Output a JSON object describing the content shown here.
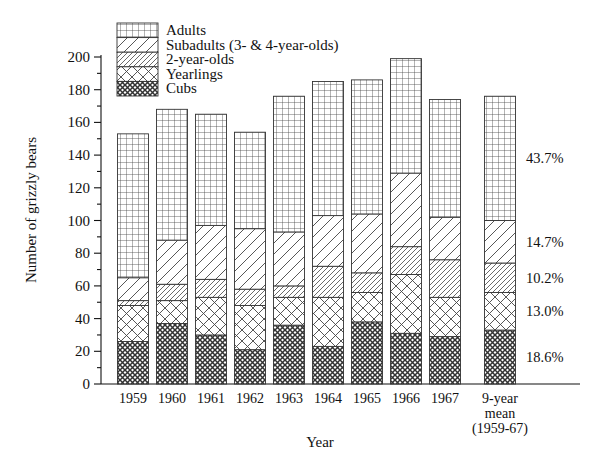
{
  "chart_data": {
    "type": "bar",
    "subtype": "stacked-bar",
    "title": "",
    "xlabel": "Year",
    "ylabel": "Number of grizzly bears",
    "ylim": [
      0,
      200
    ],
    "ytick_step": 20,
    "yticks": [
      0,
      20,
      40,
      60,
      80,
      100,
      120,
      140,
      160,
      180,
      200
    ],
    "minor_ticks": true,
    "grid": false,
    "legend_position": "top-left",
    "categories": [
      "1959",
      "1960",
      "1961",
      "1962",
      "1963",
      "1964",
      "1965",
      "1966",
      "1967",
      "9-year mean (1959-67)"
    ],
    "category_labels_multiline": [
      [
        "1959"
      ],
      [
        "1960"
      ],
      [
        "1961"
      ],
      [
        "1962"
      ],
      [
        "1963"
      ],
      [
        "1964"
      ],
      [
        "1965"
      ],
      [
        "1966"
      ],
      [
        "1967"
      ],
      [
        "9-year",
        "mean",
        "(1959-67)"
      ]
    ],
    "series": [
      {
        "name": "Cubs",
        "pattern": "dense-checker",
        "values": [
          26,
          37,
          30,
          21,
          36,
          23,
          38,
          31,
          29,
          33
        ]
      },
      {
        "name": "Yearlings",
        "pattern": "wide-crosshatch",
        "values": [
          22,
          14,
          23,
          27,
          17,
          30,
          18,
          36,
          24,
          23
        ]
      },
      {
        "name": "2-year-olds",
        "pattern": "dense-diagonal",
        "values": [
          3,
          10,
          11,
          10,
          7,
          19,
          12,
          17,
          23,
          18
        ]
      },
      {
        "name": "Subadults (3- & 4-year-olds)",
        "pattern": "wide-diagonal",
        "values": [
          14,
          27,
          33,
          37,
          33,
          31,
          36,
          45,
          26,
          26
        ]
      },
      {
        "name": "Adults",
        "pattern": "fine-grid",
        "values": [
          88,
          80,
          68,
          59,
          83,
          82,
          82,
          70,
          72,
          76
        ]
      }
    ],
    "totals": [
      153,
      168,
      165,
      154,
      176,
      185,
      186,
      199,
      174,
      176
    ],
    "mean_bar_percent_labels": [
      {
        "series": "Adults",
        "value": "43.7%"
      },
      {
        "series": "Subadults",
        "value": "14.7%"
      },
      {
        "series": "2-year-olds",
        "value": "10.2%"
      },
      {
        "series": "Yearlings",
        "value": "13.0%"
      },
      {
        "series": "Cubs",
        "value": "18.6%"
      }
    ]
  },
  "legend": {
    "items": [
      {
        "label": "Adults"
      },
      {
        "label": "Subadults (3- & 4-year-olds)"
      },
      {
        "label": "2-year-olds"
      },
      {
        "label": "Yearlings"
      },
      {
        "label": "Cubs"
      }
    ]
  },
  "axes": {
    "y_title": "Number of grizzly bears",
    "x_title": "Year",
    "y_tick_labels": [
      "0",
      "20",
      "40",
      "60",
      "80",
      "100",
      "120",
      "140",
      "160",
      "180",
      "200"
    ]
  }
}
